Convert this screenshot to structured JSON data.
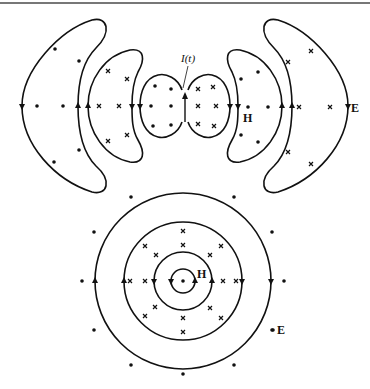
{
  "figure": {
    "top_diagram": {
      "current_label": "I(t)",
      "h_label": "H",
      "e_label": "E"
    },
    "bottom_diagram": {
      "h_label": "H",
      "e_label": "E"
    },
    "colors": {
      "ink": "#111111",
      "background": "#ffffff",
      "rule": "#777777"
    }
  }
}
